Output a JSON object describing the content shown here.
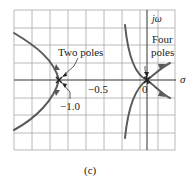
{
  "diagram": {
    "type": "root-locus",
    "caption": "(c)",
    "axes": {
      "real_axis_label": "σ",
      "imag_axis_label": "jω",
      "origin_label": "0",
      "tick_labels": [
        "−1.0",
        "−0.5"
      ]
    },
    "annotations": {
      "two_poles": "Two poles",
      "four_poles_line1": "Four",
      "four_poles_line2": "poles",
      "minus_one": "−1.0",
      "minus_half": "−0.5"
    },
    "poles": [
      {
        "location": -1.0,
        "multiplicity": 2,
        "label": "Two poles"
      },
      {
        "location": 0,
        "multiplicity": 4,
        "label": "Four poles"
      }
    ],
    "colors": {
      "grid": "#9a9a9a",
      "curve": "#5a5a5a",
      "text": "#222222",
      "background": "#ffffff"
    }
  }
}
